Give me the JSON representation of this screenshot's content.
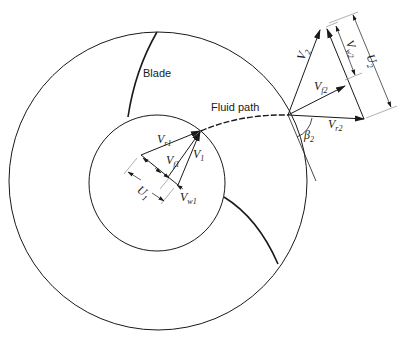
{
  "diagram": {
    "type": "centrifugal impeller velocity triangles",
    "labels": {
      "blade": "Blade",
      "fluid_path": "Fluid path",
      "vr1": {
        "main": "V",
        "sub": "r1"
      },
      "vf1": {
        "main": "V",
        "sub": "f1"
      },
      "v1": {
        "main": "V",
        "sub": "1"
      },
      "u1": {
        "main": "U",
        "sub": "1"
      },
      "vw1": {
        "main": "V",
        "sub": "w1"
      },
      "v2": {
        "main": "V",
        "sub": "2"
      },
      "vf2": {
        "main": "V",
        "sub": "f2"
      },
      "vr2": {
        "main": "V",
        "sub": "r2"
      },
      "vw2": {
        "main": "V",
        "sub": "w2"
      },
      "u2": {
        "main": "U",
        "sub": "2"
      },
      "beta2": {
        "main": "β",
        "sub": "2"
      }
    },
    "colors": {
      "line": "#1a1a1a",
      "dimension": "#9a9a9a",
      "background": "#ffffff"
    }
  }
}
